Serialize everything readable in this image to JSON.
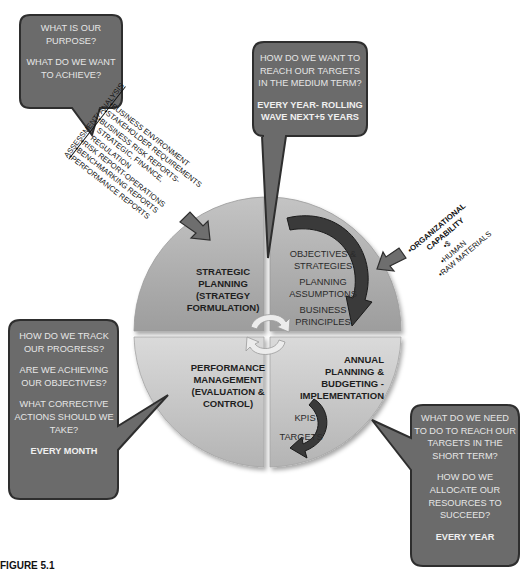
{
  "diagram": {
    "type": "cycle-diagram",
    "center": {
      "quadrants": {
        "top_left": {
          "label": [
            "STRATEGIC",
            "PLANNING",
            "(STRATEGY",
            "FORMULATION)"
          ]
        },
        "top_right": {
          "items": [
            [
              "OBJECTIVES &",
              "STRATEGIES"
            ],
            [
              "PLANNING",
              "ASSUMPTIONS"
            ],
            [
              "BUSINESS",
              "PRINCIPLES"
            ]
          ]
        },
        "bottom_right": {
          "label": [
            "ANNUAL",
            "PLANNING &",
            "BUDGETING -",
            "IMPLEMENTATION"
          ],
          "items": [
            "KPIS",
            "TARGETS"
          ]
        },
        "bottom_left": {
          "label": [
            "PERFORMANCE",
            "MANAGEMENT",
            "(EVALUATION &",
            "CONTROL)"
          ]
        }
      }
    },
    "callouts": {
      "top_left": {
        "paragraphs": [
          "WHAT IS OUR PURPOSE?",
          "WHAT DO WE WANT TO ACHIEVE?"
        ]
      },
      "top_center": {
        "paragraphs": [
          "HOW DO WE WANT TO REACH OUR TARGETS IN THE MEDIUM TERM?"
        ],
        "emphasis": "EVERY YEAR- ROLLING WAVE NEXT+5 YEARS"
      },
      "bottom_left": {
        "paragraphs": [
          "HOW DO WE TRACK OUR PROGRESS?",
          "ARE WE ACHIEVING OUR OBJECTIVES?",
          "WHAT CORRECTIVE ACTIONS SHOULD WE TAKE?"
        ],
        "emphasis": "EVERY MONTH"
      },
      "bottom_right": {
        "paragraphs": [
          "WHAT DO WE NEED TO DO TO REACH OUR TARGETS IN THE SHORT TERM?",
          "HOW DO WE ALLOCATE OUR RESOURCES TO SUCCEED?"
        ],
        "emphasis": "EVERY YEAR"
      }
    },
    "inputs": {
      "assessment": {
        "heading": "ASSESSMENT/ ANALYSIS",
        "items": [
          "•BUSINESS ENVIRONMENT",
          "•STAKEHOLDER REQUIREMENTS",
          "•BUSINESS RISK REPORTS-",
          "STRATEGIC, FINANCE,",
          "REGULATION",
          "•RISK REPORT-OPERATIONS",
          "•BENCHMARKING REPORTS",
          "•PERFORMANCE REPORTS"
        ]
      },
      "capability": {
        "items": [
          "•ORGANIZATIONAL",
          "CAPABILITY",
          "•$",
          "•HUMAN",
          "•RAW MATERIALS"
        ]
      }
    },
    "colors": {
      "callout_fill": "#6b6b6b",
      "callout_border": "#2e2e2e",
      "quad_top": "#a9a9a9",
      "quad_bottom": "#cbcbcb",
      "arrow_dark": "#3a3a3a",
      "arrow_mid": "#6e6e6e",
      "cycle_arrow": "#e4e4e4"
    }
  },
  "figure_label": "FIGURE 5.1"
}
